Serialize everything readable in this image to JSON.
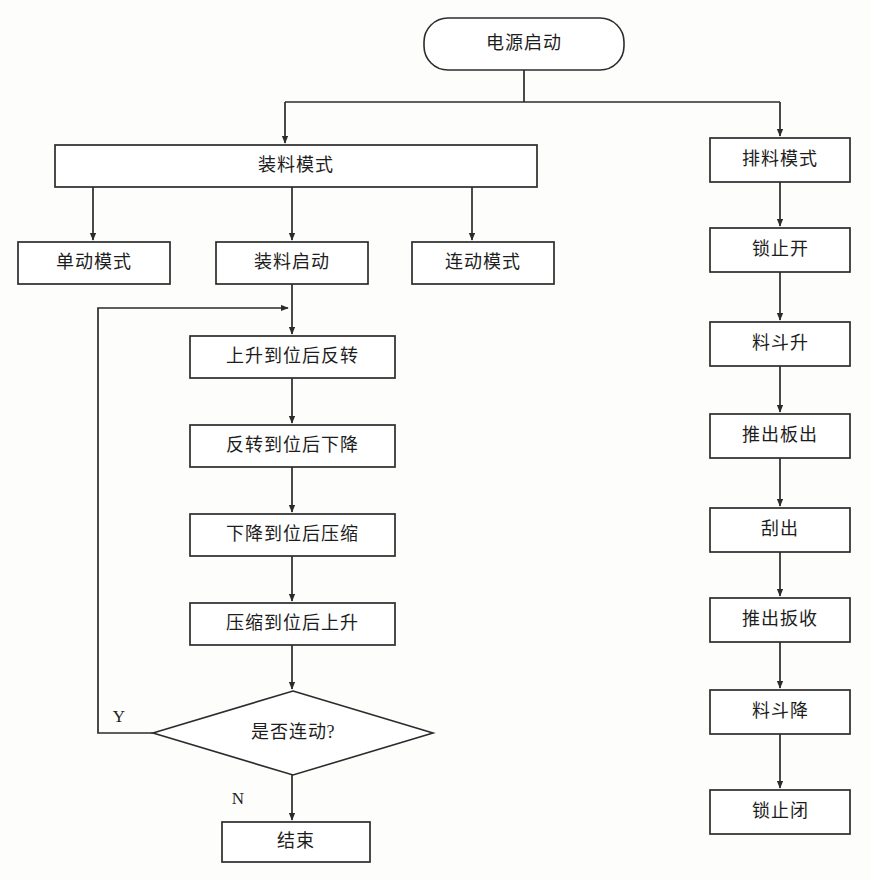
{
  "diagram": {
    "type": "flowchart",
    "canvas": {
      "width": 870,
      "height": 880
    },
    "style": {
      "background": "#fdfdfc",
      "stroke": "#2c2c2c",
      "fill": "#ffffff",
      "text": "#1d1d1d"
    },
    "nodes": [
      {
        "id": "start",
        "label": "电源启动",
        "shape": "rounded",
        "x": 424,
        "y": 18,
        "w": 200,
        "h": 52
      },
      {
        "id": "load-mode",
        "label": "装料模式",
        "shape": "rect",
        "x": 55,
        "y": 145,
        "w": 482,
        "h": 42
      },
      {
        "id": "unload-mode",
        "label": "排料模式",
        "shape": "rect",
        "x": 710,
        "y": 138,
        "w": 140,
        "h": 44
      },
      {
        "id": "single-mode",
        "label": "单动模式",
        "shape": "rect",
        "x": 18,
        "y": 242,
        "w": 152,
        "h": 42
      },
      {
        "id": "load-start",
        "label": "装料启动",
        "shape": "rect",
        "x": 216,
        "y": 242,
        "w": 152,
        "h": 42
      },
      {
        "id": "linked-mode",
        "label": "连动模式",
        "shape": "rect",
        "x": 412,
        "y": 242,
        "w": 142,
        "h": 42
      },
      {
        "id": "step-1",
        "label": "上升到位后反转",
        "shape": "rect",
        "x": 190,
        "y": 336,
        "w": 205,
        "h": 42
      },
      {
        "id": "step-2",
        "label": "反转到位后下降",
        "shape": "rect",
        "x": 190,
        "y": 425,
        "w": 205,
        "h": 42
      },
      {
        "id": "step-3",
        "label": "下降到位后压缩",
        "shape": "rect",
        "x": 190,
        "y": 514,
        "w": 205,
        "h": 42
      },
      {
        "id": "step-4",
        "label": "压缩到位后上升",
        "shape": "rect",
        "x": 190,
        "y": 603,
        "w": 205,
        "h": 42
      },
      {
        "id": "decision",
        "label": "是否连动?",
        "shape": "diamond",
        "x": 153,
        "y": 691,
        "w": 280,
        "h": 84
      },
      {
        "id": "end",
        "label": "结束",
        "shape": "rect",
        "x": 222,
        "y": 822,
        "w": 148,
        "h": 40
      },
      {
        "id": "u-1",
        "label": "锁止开",
        "shape": "rect",
        "x": 710,
        "y": 228,
        "w": 140,
        "h": 44
      },
      {
        "id": "u-2",
        "label": "料斗升",
        "shape": "rect",
        "x": 710,
        "y": 322,
        "w": 140,
        "h": 44
      },
      {
        "id": "u-3",
        "label": "推出板出",
        "shape": "rect",
        "x": 710,
        "y": 414,
        "w": 140,
        "h": 44
      },
      {
        "id": "u-4",
        "label": "刮出",
        "shape": "rect",
        "x": 710,
        "y": 508,
        "w": 140,
        "h": 44
      },
      {
        "id": "u-5",
        "label": "推出扳收",
        "shape": "rect",
        "x": 710,
        "y": 598,
        "w": 140,
        "h": 44
      },
      {
        "id": "u-6",
        "label": "料斗降",
        "shape": "rect",
        "x": 710,
        "y": 690,
        "w": 140,
        "h": 44
      },
      {
        "id": "u-7",
        "label": "锁止闭",
        "shape": "rect",
        "x": 710,
        "y": 790,
        "w": 140,
        "h": 44
      }
    ],
    "edges": [
      {
        "id": "e-start-bus",
        "from": "start",
        "to": "bus",
        "points": "524,70 524,102",
        "arrow": false
      },
      {
        "id": "e-bus",
        "from": "bus",
        "to": "bus",
        "points": "285,102 780,102",
        "arrow": false
      },
      {
        "id": "e-bus-load",
        "from": "bus",
        "to": "load-mode",
        "points": "285,102 285,143",
        "arrow": true
      },
      {
        "id": "e-bus-unload",
        "from": "bus",
        "to": "unload-mode",
        "points": "780,102 780,136",
        "arrow": true
      },
      {
        "id": "e-load-single",
        "from": "load-mode",
        "to": "single-mode",
        "points": "93,187 93,240",
        "arrow": true
      },
      {
        "id": "e-load-loadstart",
        "from": "load-mode",
        "to": "load-start",
        "points": "292,187 292,240",
        "arrow": true
      },
      {
        "id": "e-load-linked",
        "from": "load-mode",
        "to": "linked-mode",
        "points": "472,187 472,240",
        "arrow": true
      },
      {
        "id": "e-loadstart-step1",
        "from": "load-start",
        "to": "step-1",
        "points": "292,284 292,334",
        "arrow": true
      },
      {
        "id": "e-step1-step2",
        "from": "step-1",
        "to": "step-2",
        "points": "292,378 292,423",
        "arrow": true
      },
      {
        "id": "e-step2-step3",
        "from": "step-2",
        "to": "step-3",
        "points": "292,467 292,512",
        "arrow": true
      },
      {
        "id": "e-step3-step4",
        "from": "step-3",
        "to": "step-4",
        "points": "292,556 292,601",
        "arrow": true
      },
      {
        "id": "e-step4-decision",
        "from": "step-4",
        "to": "decision",
        "points": "292,645 292,689",
        "arrow": true
      },
      {
        "id": "e-decision-end",
        "from": "decision",
        "to": "end",
        "points": "292,775 292,820",
        "arrow": true,
        "label": "N",
        "label_x": 238,
        "label_y": 800
      },
      {
        "id": "e-decision-loop",
        "from": "decision",
        "to": "step-1",
        "points": "153,733 98,733 98,308 288,308",
        "arrow": true,
        "label": "Y",
        "label_x": 119,
        "label_y": 718
      },
      {
        "id": "e-unload-u1",
        "from": "unload-mode",
        "to": "u-1",
        "points": "780,182 780,226",
        "arrow": true
      },
      {
        "id": "e-u1-u2",
        "from": "u-1",
        "to": "u-2",
        "points": "780,272 780,320",
        "arrow": true
      },
      {
        "id": "e-u2-u3",
        "from": "u-2",
        "to": "u-3",
        "points": "780,366 780,412",
        "arrow": true
      },
      {
        "id": "e-u3-u4",
        "from": "u-3",
        "to": "u-4",
        "points": "780,458 780,506",
        "arrow": true
      },
      {
        "id": "e-u4-u5",
        "from": "u-4",
        "to": "u-5",
        "points": "780,552 780,596",
        "arrow": true
      },
      {
        "id": "e-u5-u6",
        "from": "u-5",
        "to": "u-6",
        "points": "780,642 780,688",
        "arrow": true
      },
      {
        "id": "e-u6-u7",
        "from": "u-6",
        "to": "u-7",
        "points": "780,734 780,788",
        "arrow": true
      }
    ]
  }
}
